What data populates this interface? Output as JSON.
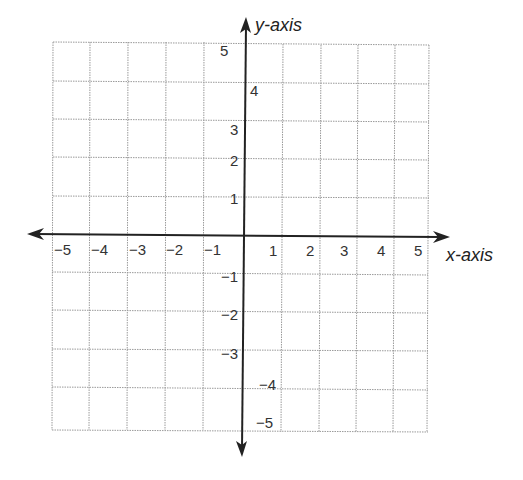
{
  "diagram": {
    "type": "coordinate-plane",
    "x_axis": {
      "title": "x-axis",
      "range": [
        -5,
        5
      ],
      "tick_labels": [
        "−5",
        "−4",
        "−3",
        "−2",
        "−1",
        "1",
        "2",
        "3",
        "4",
        "5"
      ]
    },
    "y_axis": {
      "title": "y-axis",
      "range": [
        -5,
        5
      ],
      "tick_labels": [
        "5",
        "4",
        "3",
        "2",
        "1",
        "−1",
        "−2",
        "−3",
        "−4",
        "−5"
      ]
    },
    "grid": {
      "on": true,
      "style": "dotted",
      "cells_per_quadrant": 5
    },
    "colors": {
      "axis": "#222222",
      "grid": "#9a9a9a",
      "label": "#333333"
    }
  }
}
